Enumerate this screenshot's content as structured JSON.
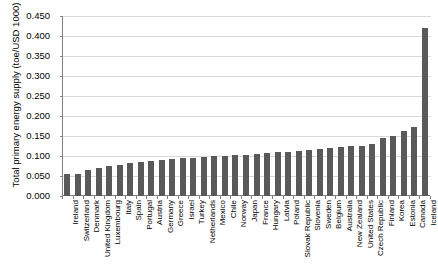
{
  "chart_data": {
    "type": "bar",
    "title": "",
    "xlabel": "",
    "ylabel": "Total primary energy supply (toe/USD 1000)",
    "ylim": [
      0.0,
      0.45
    ],
    "ytick_labels": [
      "0.450",
      "0.400",
      "0.350",
      "0.300",
      "0.250",
      "0.200",
      "0.150",
      "0.100",
      "0.050",
      "0.000"
    ],
    "ytick_values": [
      0.45,
      0.4,
      0.35,
      0.3,
      0.25,
      0.2,
      0.15,
      0.1,
      0.05,
      0.0
    ],
    "grid": true,
    "legend": "none",
    "bar_color": "#595959",
    "categories": [
      "Ireland",
      "Switzerland",
      "Denmark",
      "United Kingdom",
      "Luxembourg",
      "Italy",
      "Spain",
      "Portugal",
      "Austria",
      "Germany",
      "Greece",
      "Israel",
      "Turkey",
      "Netherlands",
      "Mexico",
      "Chile",
      "Norway",
      "Japan",
      "France",
      "Hungary",
      "Latvia",
      "Poland",
      "Slovak Republic",
      "Slovenia",
      "Sweden",
      "Belgium",
      "Australia",
      "New Zealand",
      "United States",
      "Czech Republic",
      "Finland",
      "Korea",
      "Estonia",
      "Canada",
      "Iceland"
    ],
    "values": [
      0.055,
      0.056,
      0.066,
      0.071,
      0.074,
      0.078,
      0.083,
      0.085,
      0.088,
      0.09,
      0.092,
      0.094,
      0.096,
      0.097,
      0.099,
      0.1,
      0.102,
      0.103,
      0.105,
      0.107,
      0.109,
      0.111,
      0.113,
      0.115,
      0.118,
      0.12,
      0.122,
      0.124,
      0.126,
      0.131,
      0.146,
      0.151,
      0.163,
      0.172,
      0.42
    ]
  }
}
